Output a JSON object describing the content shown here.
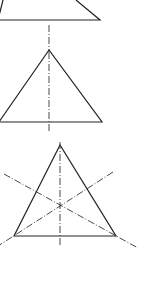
{
  "diagram": {
    "stroke_color": "#222222",
    "background": "#ffffff",
    "figures": [
      {
        "name": "top-triangle",
        "points": [
          [
            -60,
            -60
          ],
          [
            100,
            20
          ],
          [
            -2,
            20
          ]
        ],
        "axis": [
          [
            49,
            24
          ],
          [
            49,
            48
          ]
        ]
      },
      {
        "name": "middle-triangle",
        "apex": [
          49,
          50
        ],
        "base_left": [
          -2,
          122
        ],
        "base_right": [
          102,
          122
        ],
        "axis": [
          [
            49,
            28
          ],
          [
            49,
            132
          ]
        ]
      },
      {
        "name": "bottom-triangle",
        "apex": [
          60,
          145
        ],
        "base_left": [
          14,
          236
        ],
        "base_right": [
          116,
          236
        ],
        "axes": [
          [
            [
              60,
              140
            ],
            [
              60,
              245
            ]
          ],
          [
            [
              4,
              174
            ],
            [
              138,
              248
            ]
          ],
          [
            [
              113,
              172
            ],
            [
              -2,
              246
            ]
          ]
        ]
      }
    ]
  }
}
